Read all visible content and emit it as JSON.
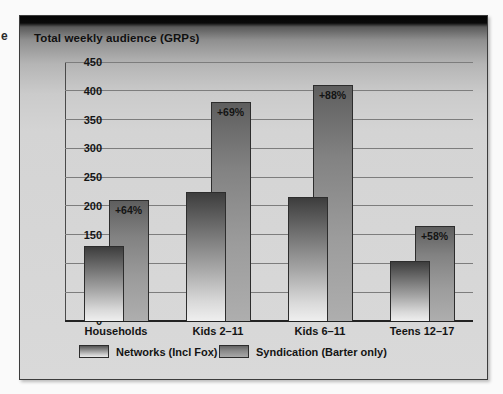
{
  "page": {
    "margin_fragment": "e"
  },
  "chart": {
    "title": "Total weekly audience (GRPs)",
    "legend": [
      {
        "label": "Networks (Incl Fox)"
      },
      {
        "label": "Syndication (Barter only)"
      }
    ]
  },
  "chart_data": {
    "type": "bar",
    "title": "Total weekly audience (GRPs)",
    "categories": [
      "Households",
      "Kids 2–11",
      "Kids 6–11",
      "Teens 12–17"
    ],
    "series": [
      {
        "name": "Networks (Incl Fox)",
        "values": [
          130,
          225,
          215,
          105
        ]
      },
      {
        "name": "Syndication (Barter only)",
        "values": [
          210,
          380,
          410,
          165
        ]
      }
    ],
    "annotations": [
      "+64%",
      "+69%",
      "+88%",
      "+58%"
    ],
    "xlabel": "",
    "ylabel": "",
    "ylim": [
      0,
      450
    ],
    "ytick_step": 50,
    "grid": true,
    "legend_position": "bottom",
    "bar_style": "overlapping",
    "colors": {
      "panel_background_top": "#050505",
      "panel_background": "#d5d5d5",
      "networks_bar_top": "#3d3d3d",
      "networks_bar_bottom": "#efefef",
      "syndication_bar_top": "#5e5e5e",
      "syndication_bar_bottom": "#aeaeae",
      "gridline": "#7d7d7d",
      "text": "#141414"
    }
  }
}
